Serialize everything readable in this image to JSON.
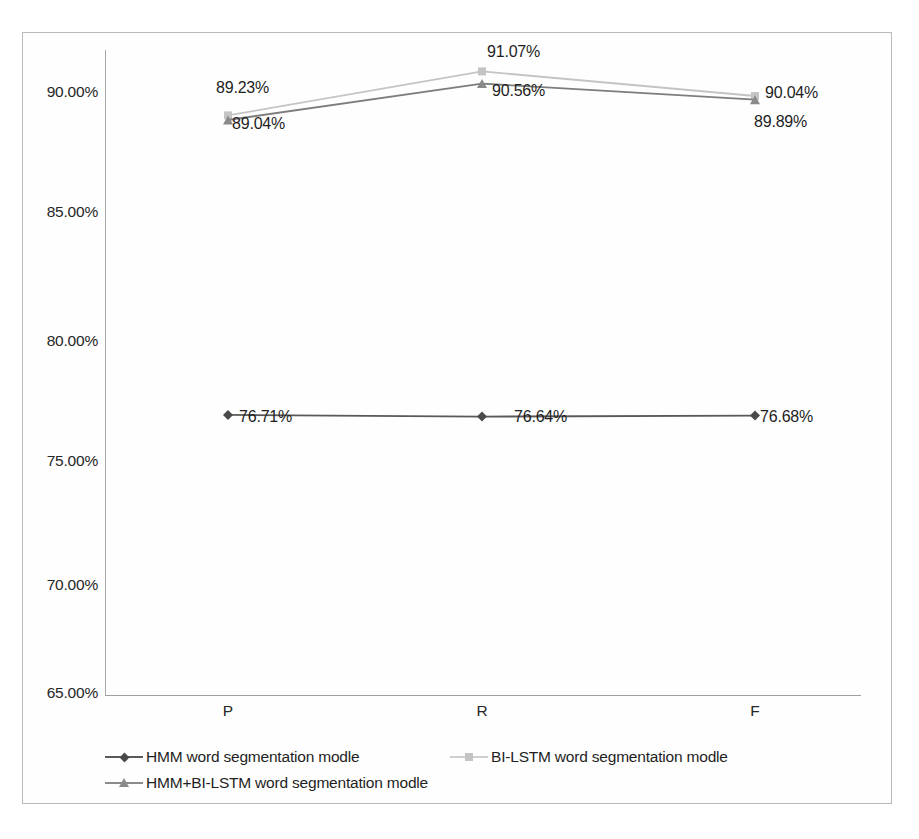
{
  "chart_data": {
    "type": "line",
    "title": "",
    "xlabel": "",
    "ylabel": "",
    "categories": [
      "P",
      "R",
      "F"
    ],
    "ylim": [
      65.0,
      90.0
    ],
    "y_ticks": [
      "65.00%",
      "70.00%",
      "75.00%",
      "80.00%",
      "85.00%",
      "90.00%"
    ],
    "y_tick_values": [
      65.0,
      70.0,
      75.0,
      80.0,
      85.0,
      90.0
    ],
    "grid": false,
    "legend_position": "bottom",
    "series": [
      {
        "name": "HMM word segmentation modle",
        "marker": "diamond",
        "color": "#595959",
        "values": [
          76.71,
          76.64,
          76.68
        ],
        "labels": [
          "76.71%",
          "76.64%",
          "76.68%"
        ]
      },
      {
        "name": "BI-LSTM word segmentation modle",
        "marker": "square",
        "color": "#c4c4c4",
        "values": [
          89.23,
          91.07,
          90.04
        ],
        "labels": [
          "89.23%",
          "91.07%",
          "90.04%"
        ]
      },
      {
        "name": "HMM+BI-LSTM word segmentation modle",
        "marker": "triangle",
        "color": "#8a8a8a",
        "values": [
          89.04,
          90.56,
          89.89
        ],
        "labels": [
          "89.04%",
          "90.56%",
          "89.89%"
        ]
      }
    ]
  },
  "axis": {
    "y_labels": [
      "90.00%",
      "85.00%",
      "80.00%",
      "75.00%",
      "70.00%",
      "65.00%"
    ],
    "x_labels": [
      "P",
      "R",
      "F"
    ]
  },
  "legend": {
    "row1": [
      "HMM word segmentation modle",
      "BI-LSTM word segmentation modle"
    ],
    "row2": [
      "HMM+BI-LSTM word segmentation modle"
    ]
  },
  "data_labels": [
    {
      "text": "89.23%",
      "x": 216,
      "y": 79
    },
    {
      "text": "91.07%",
      "x": 487,
      "y": 43
    },
    {
      "text": "90.04%",
      "x": 765,
      "y": 84
    },
    {
      "text": "89.04%",
      "x": 232,
      "y": 115
    },
    {
      "text": "90.56%",
      "x": 492,
      "y": 82
    },
    {
      "text": "89.89%",
      "x": 754,
      "y": 113
    },
    {
      "text": "76.71%",
      "x": 239,
      "y": 408
    },
    {
      "text": "76.64%",
      "x": 514,
      "y": 408
    },
    {
      "text": "76.68%",
      "x": 760,
      "y": 408
    }
  ],
  "colors": {
    "hmm": "#595959",
    "bilstm": "#c4c4c4",
    "hybrid": "#8a8a8a",
    "axis": "#a8a8a8",
    "frame": "#b9b9b9",
    "text": "#262626"
  }
}
